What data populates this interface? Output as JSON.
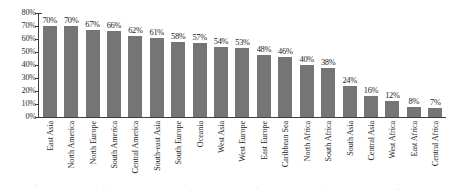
{
  "chart_data": {
    "type": "bar",
    "title": "",
    "subtitle": "",
    "xlabel": "",
    "ylabel": "",
    "ylim": [
      0,
      80
    ],
    "grid": false,
    "legend": false,
    "orientation": "vertical",
    "value_labels_shown": true,
    "value_label_suffix": "%",
    "bar_color": "#757575",
    "axis_color": "#3d3d3d",
    "text_color": "#262626",
    "background_color": "#ffffff",
    "y_ticks": [
      "0%",
      "10%",
      "20%",
      "30%",
      "40%",
      "50%",
      "60%",
      "70%",
      "80%"
    ],
    "y_tick_values": [
      0,
      10,
      20,
      30,
      40,
      50,
      60,
      70,
      80
    ],
    "categories": [
      "East Asia",
      "North America",
      "North Europe",
      "South America",
      "Central America",
      "South-east Asia",
      "South Europe",
      "Oceania",
      "West Asia",
      "West Europe",
      "East Europe",
      "Caribbean Sea",
      "North Africa",
      "South Africa",
      "South Asia",
      "Central Asia",
      "West Africa",
      "East Africa",
      "Central Africa"
    ],
    "values": [
      70,
      70,
      67,
      66,
      62,
      61,
      58,
      57,
      54,
      53,
      48,
      46,
      40,
      38,
      24,
      16,
      12,
      8,
      7
    ],
    "value_labels": [
      "70%",
      "70%",
      "67%",
      "66%",
      "62%",
      "61%",
      "58%",
      "57%",
      "54%",
      "53%",
      "48%",
      "46%",
      "40%",
      "38%",
      "24%",
      "16%",
      "12%",
      "8%",
      "7%"
    ]
  }
}
